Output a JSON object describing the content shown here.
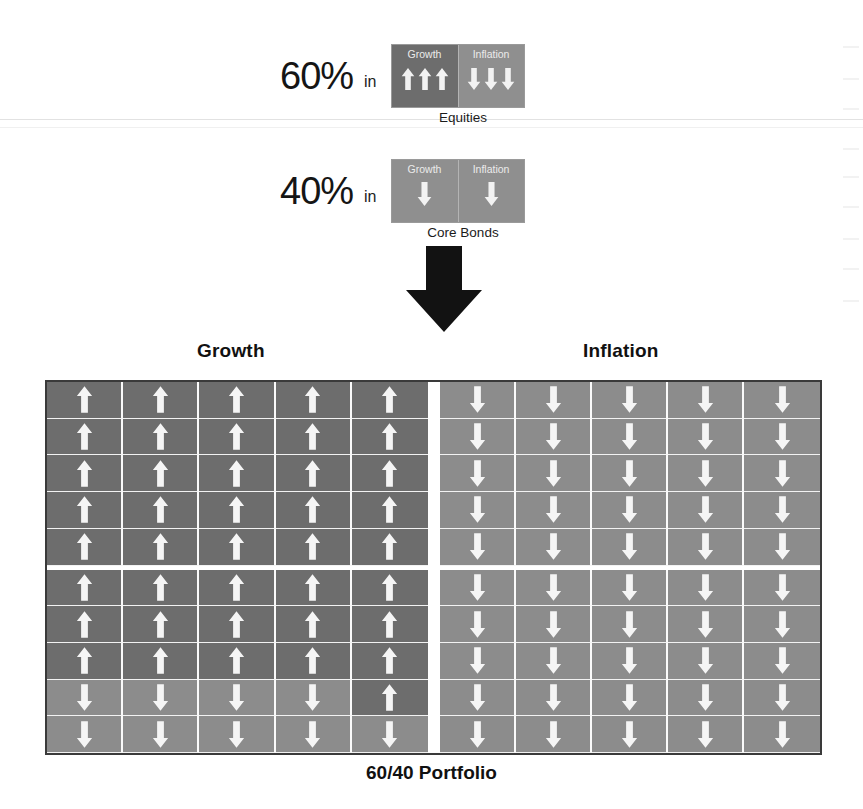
{
  "figure": {
    "bottom_caption": "60/40 Portfolio",
    "grid_headers": {
      "growth": "Growth",
      "inflation": "Inflation"
    }
  },
  "allocations": [
    {
      "percent": "60%",
      "connector": "in",
      "caption": "Equities",
      "halves": [
        {
          "label": "Growth",
          "tone": "dark",
          "arrows": [
            "up",
            "up",
            "up"
          ]
        },
        {
          "label": "Inflation",
          "tone": "light",
          "arrows": [
            "down",
            "down",
            "down"
          ]
        }
      ]
    },
    {
      "percent": "40%",
      "connector": "in",
      "caption": "Core Bonds",
      "halves": [
        {
          "label": "Growth",
          "tone": "light",
          "arrows": [
            "down"
          ]
        },
        {
          "label": "Inflation",
          "tone": "light",
          "arrows": [
            "down"
          ]
        }
      ]
    }
  ],
  "flow_arrow": {
    "icon": "down-arrow-icon",
    "color": "#111111"
  },
  "chart_data": {
    "type": "heatmap",
    "title": "60/40 Portfolio",
    "xlabel": "",
    "ylabel": "",
    "grid": true,
    "legend_position": "none",
    "columns": 5,
    "rows": 10,
    "panels": [
      {
        "name": "Growth",
        "cells": [
          [
            "up",
            "up",
            "up",
            "up",
            "up"
          ],
          [
            "up",
            "up",
            "up",
            "up",
            "up"
          ],
          [
            "up",
            "up",
            "up",
            "up",
            "up"
          ],
          [
            "up",
            "up",
            "up",
            "up",
            "up"
          ],
          [
            "up",
            "up",
            "up",
            "up",
            "up"
          ],
          [
            "up",
            "up",
            "up",
            "up",
            "up"
          ],
          [
            "up",
            "up",
            "up",
            "up",
            "up"
          ],
          [
            "up",
            "up",
            "up",
            "up",
            "up"
          ],
          [
            "down",
            "down",
            "down",
            "down",
            "up"
          ],
          [
            "down",
            "down",
            "down",
            "down",
            "down"
          ]
        ]
      },
      {
        "name": "Inflation",
        "cells": [
          [
            "down",
            "down",
            "down",
            "down",
            "down"
          ],
          [
            "down",
            "down",
            "down",
            "down",
            "down"
          ],
          [
            "down",
            "down",
            "down",
            "down",
            "down"
          ],
          [
            "down",
            "down",
            "down",
            "down",
            "down"
          ],
          [
            "down",
            "down",
            "down",
            "down",
            "down"
          ],
          [
            "down",
            "down",
            "down",
            "down",
            "down"
          ],
          [
            "down",
            "down",
            "down",
            "down",
            "down"
          ],
          [
            "down",
            "down",
            "down",
            "down",
            "down"
          ],
          [
            "down",
            "down",
            "down",
            "down",
            "down"
          ],
          [
            "down",
            "down",
            "down",
            "down",
            "down"
          ]
        ]
      }
    ],
    "band_break_after_row": 5,
    "colors": {
      "up_cell": "#6d6d6d",
      "down_cell": "#8c8c8c",
      "arrow": "#f5f5f5",
      "grid_border": "#3a3a3a",
      "divider": "#ffffff"
    }
  }
}
